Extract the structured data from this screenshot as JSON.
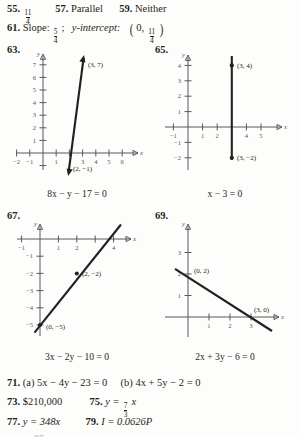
{
  "page": {
    "background": "#fdfdfb",
    "ink": "#231f20",
    "axis_color": "#56585b"
  },
  "answers_top": [
    {
      "number": "55.",
      "value_type": "fraction",
      "numerator": "11",
      "denominator": "4"
    },
    {
      "number": "57.",
      "value": "Parallel"
    },
    {
      "number": "59.",
      "value": "Neither"
    }
  ],
  "answer_61": {
    "number": "61.",
    "slope_label": "Slope:",
    "slope_numerator": "5",
    "slope_denominator": "4",
    "separator": ";",
    "intercept_label": "y-intercept:",
    "intercept_x": "0",
    "intercept_numerator": "11",
    "intercept_denominator": "4"
  },
  "answers_bottom": [
    {
      "number": "71.",
      "part_a_label": "(a)",
      "part_a": "5x − 4y − 23 = 0",
      "part_b_label": "(b)",
      "part_b": "4x + 5y − 2 = 0"
    },
    {
      "number": "73.",
      "value": "$210,000"
    },
    {
      "number": "75.",
      "prefix": "y =",
      "numerator": "7",
      "denominator": "3",
      "suffix": "x"
    },
    {
      "number": "77.",
      "value": "y = 348x"
    },
    {
      "number": "79.",
      "value": "I = 0.0626P"
    }
  ],
  "cut_off_bottom": "85.",
  "graphs": [
    {
      "number": "63.",
      "equation": "8x − y − 17 = 0",
      "type": "line",
      "x_axis_label": "x",
      "y_axis_label": "y",
      "xlim": [
        -2.8,
        6.9
      ],
      "ylim": [
        -1.6,
        7.9
      ],
      "x_ticks": [
        -2,
        -1,
        1,
        3,
        4,
        5,
        6
      ],
      "x_ticks_all": [
        -2,
        -1,
        1,
        2,
        3,
        4,
        5,
        6
      ],
      "y_ticks": [
        1,
        2,
        3,
        4,
        5,
        6,
        7
      ],
      "points": [
        {
          "x": 3,
          "y": 7,
          "label": "(3, 7)",
          "label_dx": 5,
          "label_dy": -1
        },
        {
          "x": 2,
          "y": -1,
          "label": "(2, −1)",
          "label_dx": 4,
          "label_dy": 8
        }
      ],
      "segment": {
        "x1": 1.93,
        "y1": -1.6,
        "x2": 3.08,
        "y2": 7.55
      },
      "arrows": "both"
    },
    {
      "number": "65.",
      "equation": "x − 3 = 0",
      "type": "vertical-line",
      "x_axis_label": "x",
      "y_axis_label": "y",
      "xlim": [
        -1.9,
        5.9
      ],
      "ylim": [
        -2.8,
        4.8
      ],
      "x_ticks": [
        -1,
        1,
        2,
        4,
        5
      ],
      "x_ticks_all": [
        -1,
        1,
        2,
        3,
        4,
        5
      ],
      "y_ticks": [
        -2,
        -1,
        1,
        2,
        3,
        4
      ],
      "points": [
        {
          "x": 3,
          "y": 4,
          "label": "(3, 4)",
          "label_dx": 5,
          "label_dy": 0
        },
        {
          "x": 3,
          "y": -2,
          "label": "(3, −2)",
          "label_dx": 5,
          "label_dy": 2
        }
      ],
      "segment": {
        "x1": 3,
        "y1": -2.75,
        "x2": 3,
        "y2": 4.75
      },
      "arrows": "none"
    },
    {
      "number": "67.",
      "equation": "3x − 2y − 10 = 0",
      "type": "line",
      "x_axis_label": "x",
      "y_axis_label": "y",
      "xlim": [
        -1.8,
        4.9
      ],
      "ylim": [
        -5.7,
        1.2
      ],
      "x_ticks": [
        -1,
        1,
        2,
        4
      ],
      "x_ticks_all": [
        -1,
        1,
        2,
        3,
        4
      ],
      "y_ticks": [
        -1,
        -2,
        -3,
        -4,
        -5
      ],
      "points": [
        {
          "x": 2,
          "y": -2,
          "label": "(2, −2)",
          "label_dx": 5,
          "label_dy": 2
        },
        {
          "x": 0,
          "y": -5,
          "label": "(0, −5)",
          "label_dx": 5,
          "label_dy": 3
        }
      ],
      "segment": {
        "x1": -0.28,
        "y1": -5.45,
        "x2": 4.4,
        "y2": 1.55
      },
      "arrows": "none"
    },
    {
      "number": "69.",
      "equation": "2x + 3y − 6 = 0",
      "type": "line",
      "x_axis_label": "x",
      "y_axis_label": "y",
      "xlim": [
        -1.3,
        4.5
      ],
      "ylim": [
        -1.5,
        3.9
      ],
      "x_ticks": [
        1,
        2,
        3
      ],
      "x_ticks_all": [
        1,
        2,
        3
      ],
      "y_ticks": [
        1,
        2,
        3
      ],
      "points": [
        {
          "x": 0,
          "y": 2,
          "label": "(0, 2)",
          "label_dx": 6,
          "label_dy": 1
        },
        {
          "x": 3,
          "y": 0,
          "label": "(3, 0)",
          "label_dx": 3,
          "label_dy": -4
        }
      ],
      "segment": {
        "x1": -0.62,
        "y1": 2.42,
        "x2": 4.0,
        "y2": -0.66
      },
      "arrows": "none"
    }
  ]
}
